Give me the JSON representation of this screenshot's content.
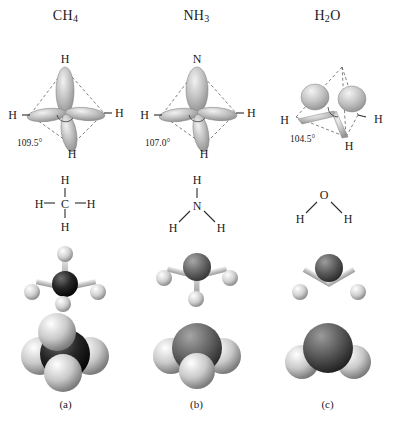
{
  "figure": {
    "background": "#ffffff",
    "columns": [
      {
        "formula": "CH",
        "formula_sub": "4",
        "caption": "(a)",
        "orbital": {
          "bond_angle": "109.5°",
          "center_label": "H",
          "top_label": "H",
          "left_label": "H",
          "right_label": "H",
          "bottom_label": "H",
          "lobe_count": 4,
          "geometry": "tetrahedral"
        },
        "lewis": {
          "center": "C",
          "top": "H",
          "left": "H",
          "right": "H",
          "bottom": "H"
        },
        "ball_and_stick": {
          "central_atom": "C",
          "central_color": "#1d1d1d",
          "hydrogen_color": "#cfcfcf",
          "hydrogen_count": 4
        },
        "space_filling": {
          "central_atom": "C",
          "central_color": "#2a2a2a",
          "hydrogen_color": "#c8c8c8",
          "hydrogen_count": 4
        }
      },
      {
        "formula": "NH",
        "formula_sub": "3",
        "caption": "(b)",
        "orbital": {
          "bond_angle": "107.0°",
          "top_label": "N",
          "left_label": "H",
          "right_label": "H",
          "bottom_label": "H",
          "lobe_count": 4,
          "geometry": "trigonal pyramidal"
        },
        "lewis": {
          "center": "N",
          "top": "H",
          "left": "H",
          "right": "H"
        },
        "ball_and_stick": {
          "central_atom": "N",
          "central_color": "#6a6a6a",
          "hydrogen_color": "#d2d2d2",
          "hydrogen_count": 3
        },
        "space_filling": {
          "central_atom": "N",
          "central_color": "#707070",
          "hydrogen_color": "#cacaca",
          "hydrogen_count": 3
        }
      },
      {
        "formula": "H",
        "formula_sub": "2",
        "formula_tail": "O",
        "caption": "(c)",
        "orbital": {
          "bond_angle": "104.5°",
          "left_label": "H",
          "right_label": "H",
          "bottom_label": "H",
          "lobe_count": 4,
          "geometry": "bent"
        },
        "lewis": {
          "center": "O",
          "left": "H",
          "right": "H"
        },
        "ball_and_stick": {
          "central_atom": "O",
          "central_color": "#5d5d5d",
          "hydrogen_color": "#d2d2d2",
          "hydrogen_count": 2
        },
        "space_filling": {
          "central_atom": "O",
          "central_color": "#5a5a5a",
          "hydrogen_color": "#c8c8c8",
          "hydrogen_count": 2
        }
      }
    ]
  }
}
